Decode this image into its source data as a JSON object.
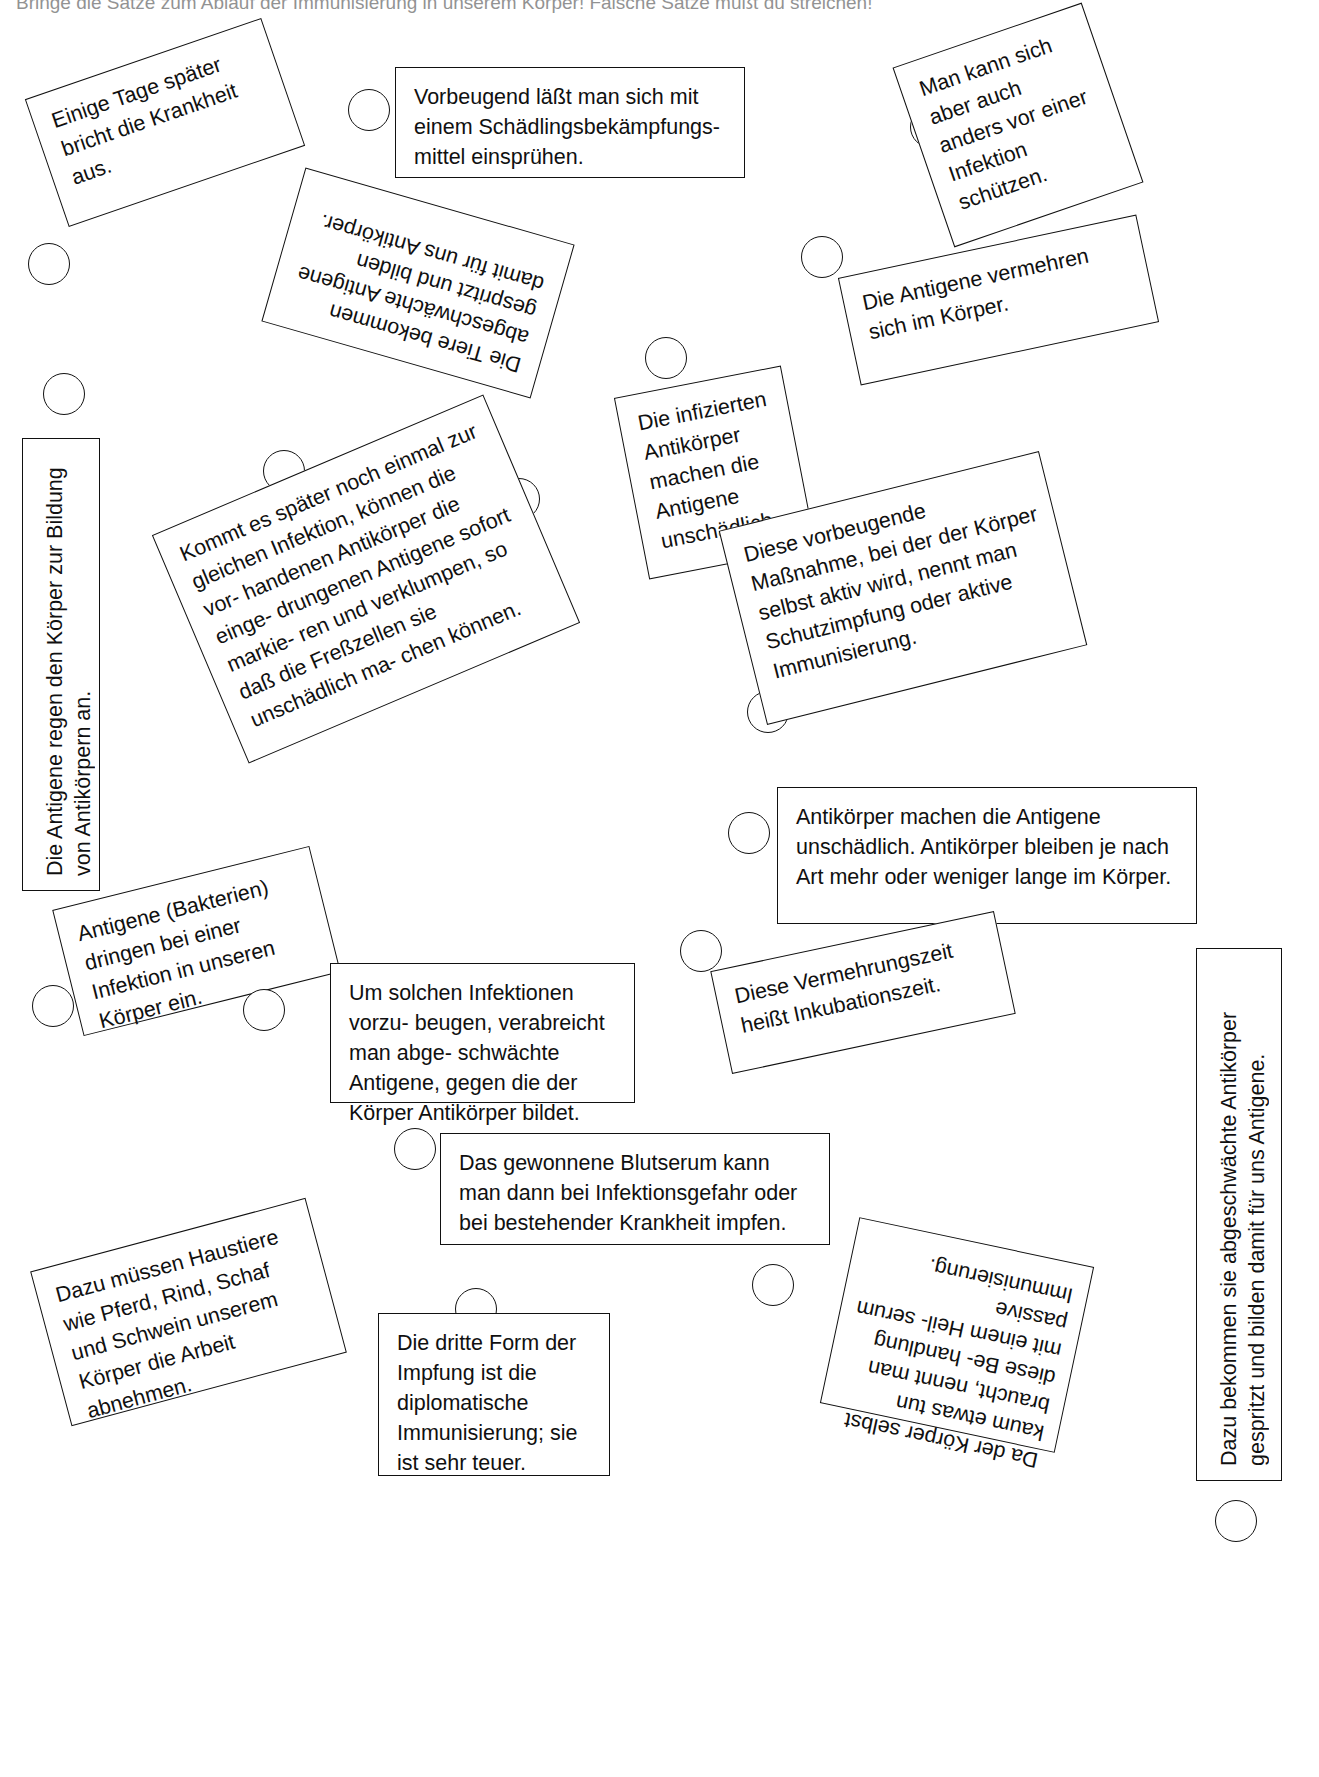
{
  "worksheet": {
    "instruction": "Bringe die Sätze zum Ablauf der Immunisierung in unserem Körper! Falsche Sätze mußt du streichen!",
    "marker_icon": "circle-bullet"
  },
  "cards": [
    {
      "id": "einige-tage-spaeter",
      "text": "Einige Tage später bricht die Krankheit aus.",
      "x": 40,
      "y": 55,
      "w": 250,
      "h": 135,
      "rot": -19,
      "style": "plain",
      "bubble": {
        "x": 28,
        "y": 243
      }
    },
    {
      "id": "vorbeugend-schaedlingsbekaempfungsmittel",
      "text": "Vorbeugend läßt man sich mit einem Schädlingsbekämpfungs- mittel einsprühen.",
      "x": 395,
      "y": 67,
      "w": 350,
      "h": 111,
      "rot": 0,
      "style": "plain",
      "bubble": {
        "x": 348,
        "y": 89
      }
    },
    {
      "id": "man-kann-sich-anders-schuetzen",
      "text": "Man kann sich aber auch anders vor einer Infektion schützen.",
      "x": 918,
      "y": 30,
      "w": 200,
      "h": 190,
      "rot": -19,
      "style": "plain",
      "bubble": {
        "x": 910,
        "y": 106
      }
    },
    {
      "id": "antigene-vermehren-sich",
      "text": "Die Antigene vermehren sich im Körper.",
      "x": 846,
      "y": 245,
      "w": 305,
      "h": 110,
      "rot": -12,
      "style": "plain",
      "bubble": {
        "x": 801,
        "y": 236
      }
    },
    {
      "id": "tiere-bekommen-abgeschwaechte-antigene",
      "text": "Die Tiere bekommen abgeschwächte Antigene gespritzt und bilden damit für uns Antikörper.",
      "x": 278,
      "y": 203,
      "w": 280,
      "h": 160,
      "rot": 196,
      "style": "upside-down",
      "bubble": {
        "x": 498,
        "y": 478
      }
    },
    {
      "id": "antigene-regen-koerper-an",
      "text": "Die Antigene regen den Körper zur Bildung von Antikörpern an.",
      "x": 22,
      "y": 438,
      "w": 78,
      "h": 453,
      "rot": 0,
      "style": "vertical-up",
      "bubble": {
        "x": 43,
        "y": 373
      }
    },
    {
      "id": "kommt-es-spaeter-zur-gleichen-infektion",
      "text": "Kommt es später noch einmal zur gleichen Infektion, können die vor- handenen Antikörper die einge- drungenen Antigene sofort markie- ren und verklumpen, so daß die Freßzellen sie unschädlich ma- chen können.",
      "x": 186,
      "y": 455,
      "w": 360,
      "h": 248,
      "rot": -23,
      "style": "plain",
      "bubble": {
        "x": 263,
        "y": 450
      }
    },
    {
      "id": "infizierte-antikoerper",
      "text": "Die infizierten Antikörper machen die Antigene unschädlich.",
      "x": 630,
      "y": 380,
      "w": 170,
      "h": 185,
      "rot": -11,
      "style": "plain",
      "bubble": {
        "x": 645,
        "y": 337
      }
    },
    {
      "id": "vorbeugende-massnahme-schutzimpfung",
      "text": "Diese vorbeugende Maßnahme, bei der der Körper selbst aktiv wird, nennt man Schutzimpfung oder aktive Immunisierung.",
      "x": 738,
      "y": 488,
      "w": 330,
      "h": 200,
      "rot": -14,
      "style": "plain",
      "bubble": {
        "x": 747,
        "y": 691
      }
    },
    {
      "id": "antikoerper-machen-antigene-unschaedlich",
      "text": "Antikörper machen die Antigene unschädlich. Antikörper bleiben je nach Art mehr oder weniger lange im Körper.",
      "x": 777,
      "y": 787,
      "w": 420,
      "h": 137,
      "rot": 0,
      "style": "plain",
      "bubble": {
        "x": 728,
        "y": 812
      }
    },
    {
      "id": "antigene-bakterien-dringen-ein",
      "text": "Antigene (Bakterien) dringen bei einer Infektion in unseren Körper ein.",
      "x": 64,
      "y": 876,
      "w": 265,
      "h": 130,
      "rot": -14,
      "style": "plain",
      "bubble": {
        "x": 32,
        "y": 985
      }
    },
    {
      "id": "um-solchen-infektionen-vorzubeugen",
      "text": "Um solchen Infektionen vorzu- beugen, verabreicht man abge- schwächte Antigene, gegen die der Körper Antikörper bildet.",
      "x": 330,
      "y": 963,
      "w": 305,
      "h": 140,
      "rot": 0,
      "style": "plain",
      "bubble": {
        "x": 243,
        "y": 989
      }
    },
    {
      "id": "vermehrungszeit-inkubationszeit",
      "text": "Diese Vermehrungszeit heißt Inkubationszeit.",
      "x": 718,
      "y": 940,
      "w": 290,
      "h": 105,
      "rot": -12,
      "style": "plain",
      "bubble": {
        "x": 680,
        "y": 930
      }
    },
    {
      "id": "dazu-bekommen-sie-abgeschwaechte-antikoerper",
      "text": "Dazu bekommen sie abgeschwächte Antikörper gespritzt und bilden damit für uns Antigene.",
      "x": 1196,
      "y": 948,
      "w": 86,
      "h": 533,
      "rot": 0,
      "style": "vertical-up",
      "bubble": {
        "x": 1215,
        "y": 1500
      }
    },
    {
      "id": "gewonnenes-blutserum-impfen",
      "text": "Das gewonnene Blutserum kann man dann bei Infektionsgefahr oder bei bestehender Krankheit impfen.",
      "x": 440,
      "y": 1133,
      "w": 390,
      "h": 112,
      "rot": 0,
      "style": "plain",
      "bubble": {
        "x": 394,
        "y": 1128
      }
    },
    {
      "id": "haustiere-arbeit-abnehmen",
      "text": "Dazu müssen Haustiere wie Pferd, Rind, Schaf und Schwein unserem Körper die Arbeit abnehmen.",
      "x": 46,
      "y": 1232,
      "w": 285,
      "h": 160,
      "rot": -15,
      "style": "plain",
      "bubble": {
        "x": 50,
        "y": 1262
      }
    },
    {
      "id": "dritte-form-diplomatische-immunisierung",
      "text": "Die dritte Form der Impfung ist die diplomatische Immunisierung; sie ist sehr teuer.",
      "x": 378,
      "y": 1313,
      "w": 232,
      "h": 163,
      "rot": 0,
      "style": "plain",
      "bubble": {
        "x": 455,
        "y": 1288
      }
    },
    {
      "id": "heilserum-passive-immunisierung",
      "text": "Da der Körper selbst kaum etwas tun braucht, nennt man diese Be- handlung mit einem Heil- serum passive Immunisierung.",
      "x": 862,
      "y": 1215,
      "w": 190,
      "h": 240,
      "rot": 102,
      "style": "rotated-cw",
      "bubble": {
        "x": 752,
        "y": 1264
      }
    }
  ]
}
